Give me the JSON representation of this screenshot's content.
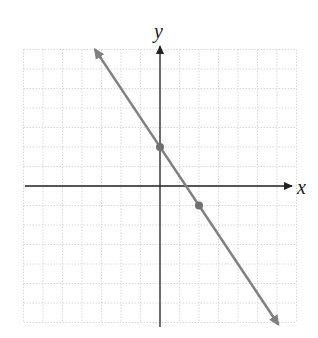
{
  "chart_data": {
    "type": "line",
    "title": "",
    "xlabel": "x",
    "ylabel": "y",
    "grid": true,
    "xlim": [
      -7,
      7
    ],
    "ylim": [
      -7,
      7
    ],
    "series": [
      {
        "name": "line",
        "equation": "y = -3/2 x + 2",
        "slope": -1.5,
        "intercept": 2,
        "points": [
          [
            0,
            2
          ],
          [
            2,
            -1
          ]
        ],
        "color": "#808080"
      }
    ]
  },
  "labels": {
    "x": "x",
    "y": "y"
  }
}
